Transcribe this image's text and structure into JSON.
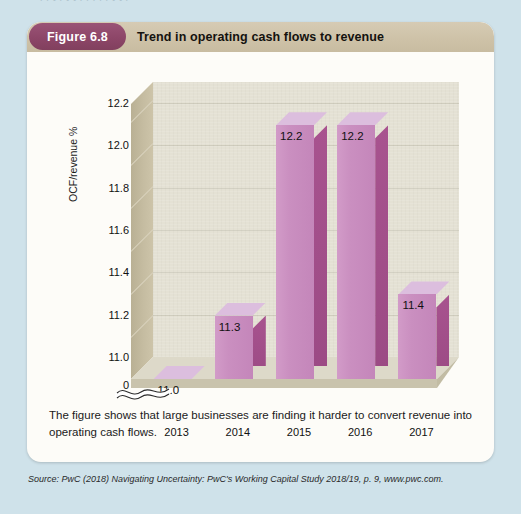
{
  "page": {
    "background_color": "#cfe2ea",
    "top_ghost_text": "i  l  t  i t  t  l  f  i       l  i t  t  i"
  },
  "figure": {
    "badge_label": "Figure 6.8",
    "badge_color": "#8d4668",
    "title": "Trend in operating cash flows to revenue",
    "header_color": "#cec2a8",
    "caption": "The figure shows that large businesses are finding it harder to convert revenue into operating cash flows.",
    "source": "Source: PwC (2018) Navigating Uncertainty: PwC's Working Capital Study 2018/19, p. 9, www.pwc.com."
  },
  "chart_data": {
    "type": "bar",
    "title": "Trend in operating cash flows to revenue",
    "xlabel": "",
    "ylabel": "OCF/revenue %",
    "categories": [
      "2013",
      "2014",
      "2015",
      "2016",
      "2017"
    ],
    "values": [
      11.0,
      11.3,
      12.2,
      12.2,
      11.4
    ],
    "data_labels": [
      "11.0",
      "11.3",
      "12.2",
      "12.2",
      "11.4"
    ],
    "ylim": [
      11.0,
      12.3
    ],
    "y_ticks": [
      "11.0",
      "11.2",
      "11.4",
      "11.6",
      "11.8",
      "12.0",
      "12.2"
    ],
    "y_tick_values": [
      11.0,
      11.2,
      11.4,
      11.6,
      11.8,
      12.0,
      12.2
    ],
    "zero_tick": "0",
    "axis_break": true,
    "axis_break_at": 11.0,
    "grid": true,
    "legend": "none",
    "style": "3d-column",
    "bar_face_color": "#ca8fc0",
    "bar_top_color": "#dcbede",
    "bar_side_color": "#a14d88",
    "plot_back_color": "#e4e1d4",
    "plot_wall_color": "#c6bda2"
  }
}
